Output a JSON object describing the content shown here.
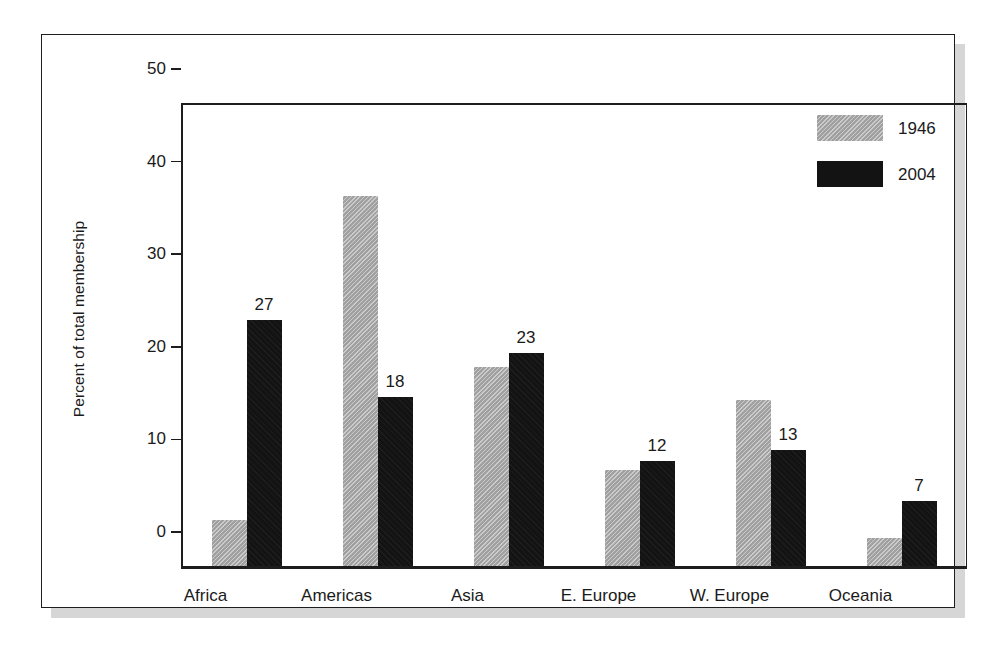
{
  "chart_data": {
    "type": "bar",
    "title": "",
    "subtitle": "",
    "xlabel": "",
    "ylabel": "Percent of total membership",
    "ylim": [
      0,
      50
    ],
    "yticks": [
      0,
      10,
      20,
      30,
      40,
      50
    ],
    "ytick_labels": [
      "0",
      "10",
      "20",
      "30",
      "40",
      "50"
    ],
    "grid": false,
    "legend_position": "top-right",
    "categories": [
      "Africa",
      "Americas",
      "Asia",
      "E. Europe",
      "W. Europe",
      "Oceania"
    ],
    "series": [
      {
        "name": "1946",
        "color": "#a9a9a9",
        "values": [
          5.0,
          40.0,
          21.5,
          10.4,
          17.9,
          3.0
        ],
        "data_labels": [
          "",
          "",
          "",
          "",
          "",
          ""
        ]
      },
      {
        "name": "2004",
        "color": "#131313",
        "values": [
          26.6,
          18.2,
          23.0,
          11.3,
          12.5,
          7.0
        ],
        "data_labels": [
          "27",
          "18",
          "23",
          "12",
          "13",
          "7"
        ]
      }
    ],
    "annotations": []
  },
  "legend": {
    "items": [
      {
        "label": "1946",
        "swatch": "gray-swatch"
      },
      {
        "label": "2004",
        "swatch": "black-swatch"
      }
    ]
  },
  "colors": {
    "series_1946": "#a9a9a9",
    "series_2004": "#131313",
    "axis": "#1d1d1d",
    "frame": "#1d1d1d",
    "shadow": "#d6d6d6",
    "background": "#ffffff",
    "text": "#1a1a1a"
  }
}
